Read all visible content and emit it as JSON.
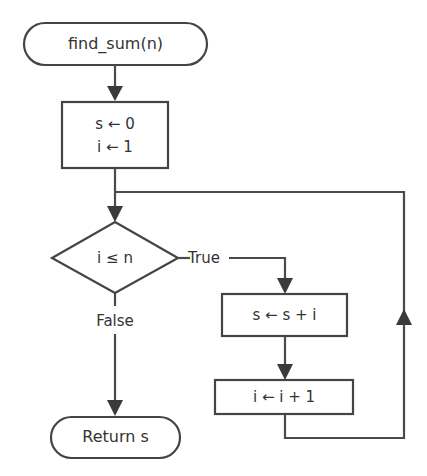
{
  "diagram": {
    "type": "flowchart",
    "title": "find_sum(n)",
    "nodes": [
      {
        "id": "start",
        "shape": "terminator",
        "label": "find_sum(n)"
      },
      {
        "id": "init",
        "shape": "process",
        "lines": [
          "s ← 0",
          "i ← 1"
        ]
      },
      {
        "id": "cond",
        "shape": "decision",
        "label": "i ≤ n"
      },
      {
        "id": "accumulate",
        "shape": "process",
        "label": "s ← s + i"
      },
      {
        "id": "increment",
        "shape": "process",
        "label": "i ← i + 1"
      },
      {
        "id": "end",
        "shape": "terminator",
        "label": "Return s"
      }
    ],
    "edges": [
      {
        "from": "start",
        "to": "init",
        "label": ""
      },
      {
        "from": "init",
        "to": "cond",
        "label": ""
      },
      {
        "from": "cond",
        "to": "accumulate",
        "label": "True"
      },
      {
        "from": "accumulate",
        "to": "increment",
        "label": ""
      },
      {
        "from": "increment",
        "to": "cond",
        "label": "",
        "note": "loop back"
      },
      {
        "from": "cond",
        "to": "end",
        "label": "False"
      }
    ],
    "edge_labels": {
      "true": "True",
      "false": "False"
    },
    "colors": {
      "stroke": "#444444",
      "text": "#333333",
      "background": "#ffffff"
    }
  }
}
